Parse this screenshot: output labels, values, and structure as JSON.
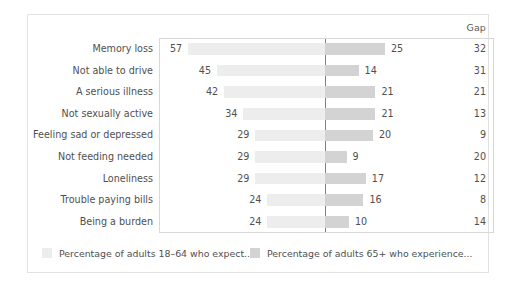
{
  "chart_data": {
    "type": "bar",
    "subtype": "diverging-bar",
    "title": "",
    "xlabel": "",
    "ylabel": "",
    "grid": false,
    "legend_position": "bottom",
    "gap_column_header": "Gap",
    "axis_center_value": 0,
    "px_per_unit": 2.4,
    "categories": [
      "Memory loss",
      "Not able to drive",
      "A serious illness",
      "Not sexually active",
      "Feeling sad or depressed",
      "Not feeding needed",
      "Loneliness",
      "Trouble paying bills",
      "Being a burden"
    ],
    "series": [
      {
        "name": "Percentage of adults 18–64 who expect...",
        "direction": "left",
        "color": "#ededed",
        "values": [
          57,
          45,
          42,
          34,
          29,
          29,
          29,
          24,
          24
        ]
      },
      {
        "name": "Percentage of adults 65+ who experience...",
        "direction": "right",
        "color": "#d3d3d3",
        "values": [
          25,
          14,
          21,
          21,
          20,
          9,
          17,
          16,
          10
        ]
      }
    ],
    "gap_values": [
      32,
      31,
      21,
      13,
      9,
      20,
      12,
      8,
      14
    ]
  },
  "legend": [
    {
      "label": "Percentage of adults 18–64 who expect...",
      "color": "#ededed"
    },
    {
      "label": "Percentage of adults 65+ who experience...",
      "color": "#d3d3d3"
    }
  ],
  "colors": {
    "card_border": "#e2e2e2",
    "plot_border": "#d8d8d8",
    "center_line": "#808080",
    "text": "#4f4f4f",
    "background": "#ffffff"
  }
}
